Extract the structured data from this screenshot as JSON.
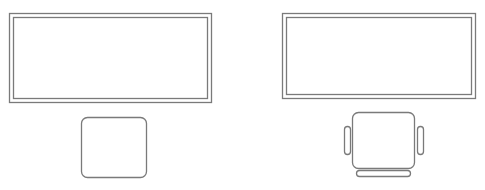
{
  "diagram": {
    "type": "floor-plan",
    "stroke_color": "#7a7a7a",
    "background": "#ffffff",
    "workstations": [
      {
        "name": "workstation-left",
        "desk": {
          "outer": {
            "x": 9,
            "y": 13,
            "w": 202,
            "h": 89
          },
          "inner": {
            "x": 13,
            "y": 17,
            "w": 194,
            "h": 81
          }
        },
        "chair": {
          "style": "simple",
          "seat": {
            "x": 81,
            "y": 117,
            "w": 65,
            "h": 60,
            "r": 6
          }
        }
      },
      {
        "name": "workstation-right",
        "desk": {
          "outer": {
            "x": 282,
            "y": 13,
            "w": 193,
            "h": 85
          },
          "inner": {
            "x": 286,
            "y": 17,
            "w": 185,
            "h": 77
          }
        },
        "chair": {
          "style": "armchair",
          "seat": {
            "x": 352,
            "y": 112,
            "w": 62,
            "h": 56,
            "r": 6
          },
          "armrest_left": {
            "x": 344,
            "y": 126,
            "w": 6,
            "h": 28,
            "r": 3
          },
          "armrest_right": {
            "x": 417,
            "y": 126,
            "w": 6,
            "h": 28,
            "r": 3
          },
          "backrest": {
            "x": 356,
            "y": 170,
            "w": 54,
            "h": 6,
            "r": 3
          }
        }
      }
    ]
  }
}
